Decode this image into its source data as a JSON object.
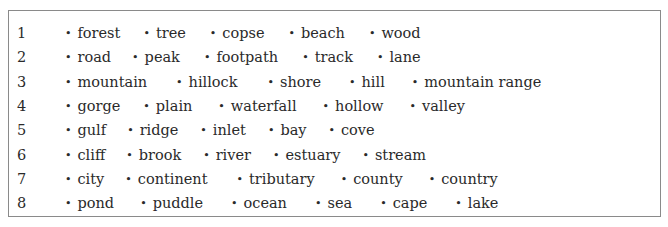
{
  "rows": [
    {
      "num": "1",
      "words": [
        "forest",
        "tree",
        "copse",
        "beach",
        "wood"
      ],
      "gaps": [
        23,
        24,
        24,
        24
      ]
    },
    {
      "num": "2",
      "words": [
        "road",
        "peak",
        "footpath",
        "track",
        "lane"
      ],
      "gaps": [
        21,
        24,
        24,
        24
      ]
    },
    {
      "num": "3",
      "words": [
        "mountain",
        "hillock",
        "shore",
        "hill",
        "mountain range"
      ],
      "gaps": [
        29,
        30,
        28,
        27
      ]
    },
    {
      "num": "4",
      "words": [
        "gorge",
        "plain",
        "waterfall",
        "hollow",
        "valley"
      ],
      "gaps": [
        23,
        26,
        26,
        26
      ]
    },
    {
      "num": "5",
      "words": [
        "gulf",
        "ridge",
        "inlet",
        "bay",
        "cove"
      ],
      "gaps": [
        21,
        22,
        22,
        22
      ]
    },
    {
      "num": "6",
      "words": [
        "cliff",
        "brook",
        "river",
        "estuary",
        "stream"
      ],
      "gaps": [
        21,
        22,
        22,
        22
      ]
    },
    {
      "num": "7",
      "words": [
        "city",
        "continent",
        "tributary",
        "county",
        "country"
      ],
      "gaps": [
        21,
        29,
        26,
        26
      ]
    },
    {
      "num": "8",
      "words": [
        "pond",
        "puddle",
        "ocean",
        "sea",
        "cape",
        "lake"
      ],
      "gaps": [
        26,
        28,
        28,
        28,
        28
      ]
    }
  ],
  "bullet": "•"
}
